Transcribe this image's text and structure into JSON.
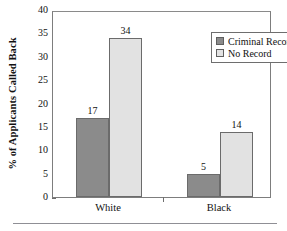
{
  "chart_data": {
    "type": "bar",
    "title": "",
    "xlabel": "",
    "ylabel": "% of Applicants Called Back",
    "categories": [
      "White",
      "Black"
    ],
    "series": [
      {
        "name": "Criminal Record",
        "values": [
          17,
          5
        ],
        "color": "#8b8b8b"
      },
      {
        "name": "No Record",
        "values": [
          34,
          14
        ],
        "color": "#e2e2e2"
      }
    ],
    "ylim": [
      0,
      40
    ],
    "yticks": [
      0,
      5,
      10,
      15,
      20,
      25,
      30,
      35,
      40
    ],
    "ytick_labels": [
      "0",
      "5",
      "10",
      "15",
      "20",
      "25",
      "30",
      "35",
      "40"
    ],
    "data_labels": [
      [
        "17",
        "34"
      ],
      [
        "5",
        "14"
      ]
    ],
    "grid": false,
    "legend_position": "top-right",
    "legend_entries": [
      "Criminal Record",
      "No Record"
    ]
  },
  "legend": {
    "items": [
      {
        "label": "Criminal Record",
        "swatch": "dark"
      },
      {
        "label": "No Record",
        "swatch": "light"
      }
    ]
  },
  "axis": {
    "y_title": "% of Applicants Called Back",
    "y_ticks": [
      "40",
      "35",
      "30",
      "25",
      "20",
      "15",
      "10",
      "5",
      "0"
    ],
    "x_groups": [
      "White",
      "Black"
    ]
  },
  "bars": [
    {
      "group": "White",
      "series": "Criminal Record",
      "value": 17,
      "label": "17"
    },
    {
      "group": "White",
      "series": "No Record",
      "value": 34,
      "label": "34"
    },
    {
      "group": "Black",
      "series": "Criminal Record",
      "value": 5,
      "label": "5"
    },
    {
      "group": "Black",
      "series": "No Record",
      "value": 14,
      "label": "14"
    }
  ]
}
